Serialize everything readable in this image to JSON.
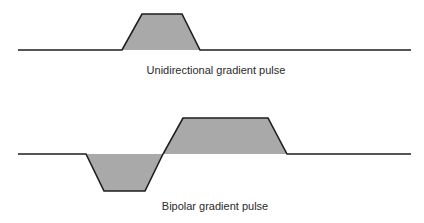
{
  "colors": {
    "fill": "#a9a9a9",
    "stroke": "#1e1e1e",
    "text": "#2a2a2a",
    "background": "#ffffff"
  },
  "diagrams": [
    {
      "id": "unidirectional",
      "label": "Unidirectional gradient pulse",
      "baseline_y": 50,
      "baseline_x": [
        18,
        411
      ],
      "lobes": [
        {
          "polarity": "positive",
          "points": [
            [
              122,
              50
            ],
            [
              142,
              14
            ],
            [
              182,
              14
            ],
            [
              200,
              50
            ]
          ]
        }
      ],
      "label_pos": {
        "x": 216,
        "y": 65
      }
    },
    {
      "id": "bipolar",
      "label": "Bipolar gradient pulse",
      "baseline_y": 154,
      "baseline_x": [
        18,
        411
      ],
      "lobes": [
        {
          "polarity": "negative",
          "points": [
            [
              86,
              154
            ],
            [
              104,
              191
            ],
            [
              145,
              191
            ],
            [
              163,
              154
            ]
          ]
        },
        {
          "polarity": "positive",
          "points": [
            [
              163,
              154
            ],
            [
              183,
              118
            ],
            [
              268,
              118
            ],
            [
              287,
              154
            ]
          ]
        }
      ],
      "label_pos": {
        "x": 215,
        "y": 201
      }
    }
  ]
}
